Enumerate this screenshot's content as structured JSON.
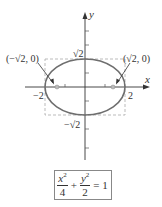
{
  "diagram": {
    "type": "ellipse-graph",
    "axes": {
      "x_label": "x",
      "y_label": "y"
    },
    "ellipse": {
      "a": 2,
      "b": "√2",
      "center": [
        0,
        0
      ]
    },
    "labels": {
      "left_focus": "(−√2, 0)",
      "right_focus": "(√2, 0)",
      "top_vertex": "√2",
      "bottom_vertex": "−√2",
      "left_vertex": "−2",
      "right_vertex": "2"
    },
    "equation": {
      "term1_num": "x",
      "term1_den": "4",
      "term2_num": "y",
      "term2_den": "2",
      "exp": "2",
      "plus": "+",
      "equals": "= 1"
    },
    "colors": {
      "ellipse": "#6e6e6e",
      "axes": "#333333",
      "dashed": "#aaaaaa",
      "focus": "#999999"
    }
  }
}
